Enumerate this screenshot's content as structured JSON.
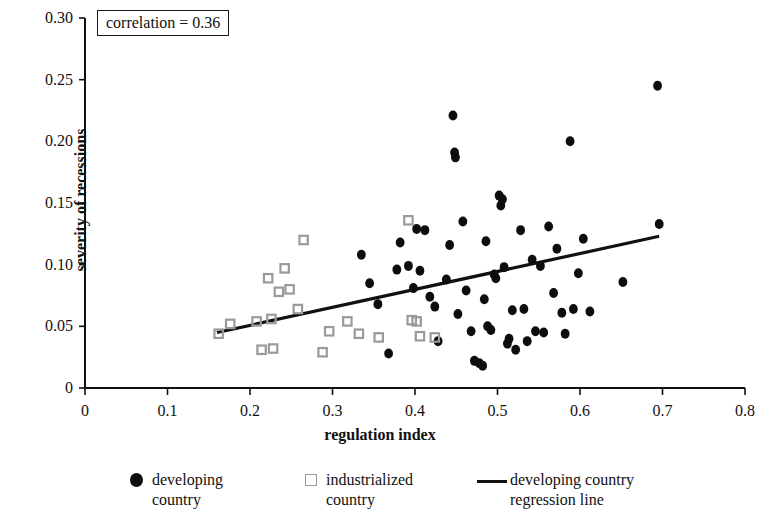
{
  "figure": {
    "annotation_label": "correlation = 0.36",
    "x_axis_title": "regulation index",
    "y_axis_title": "severity of recessions"
  },
  "legend": {
    "entries": [
      {
        "name": "developing-country",
        "label": "developing\ncountry",
        "marker": "filled-circle",
        "color": "#0d0d0d"
      },
      {
        "name": "industrialized-country",
        "label": "industrialized\ncountry",
        "marker": "open-square",
        "color": "#9a9a9a"
      },
      {
        "name": "regression-line",
        "label": "developing country\nregression line",
        "marker": "line",
        "color": "#111111"
      }
    ]
  },
  "chart_data": {
    "type": "scatter",
    "title": "",
    "xlabel": "regulation index",
    "ylabel": "severity of recessions",
    "xlim": [
      0,
      0.8
    ],
    "ylim": [
      0,
      0.3
    ],
    "xticks": [
      0,
      0.1,
      0.2,
      0.3,
      0.4,
      0.5,
      0.6,
      0.7,
      0.8
    ],
    "xtick_labels": [
      "0",
      "0.1",
      "0.2",
      "0.3",
      "0.4",
      "0.5",
      "0.6",
      "0.7",
      "0.8"
    ],
    "yticks": [
      0,
      0.05,
      0.1,
      0.15,
      0.2,
      0.25,
      0.3
    ],
    "ytick_labels": [
      "0",
      "0.05",
      "0.10",
      "0.15",
      "0.20",
      "0.25",
      "0.30"
    ],
    "grid": false,
    "legend_position": "below",
    "annotations": [
      {
        "text": "correlation = 0.36",
        "x": 0.015,
        "y": 0.295,
        "boxed": true
      }
    ],
    "series": [
      {
        "name": "developing country",
        "marker": "filled-circle",
        "color": "#0d0d0d",
        "points": [
          [
            0.335,
            0.108
          ],
          [
            0.345,
            0.085
          ],
          [
            0.355,
            0.068
          ],
          [
            0.368,
            0.028
          ],
          [
            0.378,
            0.096
          ],
          [
            0.382,
            0.118
          ],
          [
            0.392,
            0.099
          ],
          [
            0.398,
            0.081
          ],
          [
            0.402,
            0.129
          ],
          [
            0.406,
            0.095
          ],
          [
            0.412,
            0.128
          ],
          [
            0.418,
            0.074
          ],
          [
            0.424,
            0.066
          ],
          [
            0.428,
            0.038
          ],
          [
            0.438,
            0.088
          ],
          [
            0.442,
            0.116
          ],
          [
            0.446,
            0.221
          ],
          [
            0.448,
            0.191
          ],
          [
            0.449,
            0.187
          ],
          [
            0.452,
            0.06
          ],
          [
            0.458,
            0.135
          ],
          [
            0.462,
            0.079
          ],
          [
            0.468,
            0.046
          ],
          [
            0.472,
            0.022
          ],
          [
            0.478,
            0.02
          ],
          [
            0.482,
            0.018
          ],
          [
            0.484,
            0.072
          ],
          [
            0.486,
            0.119
          ],
          [
            0.488,
            0.05
          ],
          [
            0.492,
            0.047
          ],
          [
            0.496,
            0.092
          ],
          [
            0.498,
            0.089
          ],
          [
            0.502,
            0.156
          ],
          [
            0.504,
            0.148
          ],
          [
            0.506,
            0.153
          ],
          [
            0.508,
            0.098
          ],
          [
            0.512,
            0.036
          ],
          [
            0.514,
            0.04
          ],
          [
            0.518,
            0.063
          ],
          [
            0.522,
            0.031
          ],
          [
            0.528,
            0.128
          ],
          [
            0.532,
            0.064
          ],
          [
            0.536,
            0.038
          ],
          [
            0.542,
            0.104
          ],
          [
            0.546,
            0.046
          ],
          [
            0.552,
            0.099
          ],
          [
            0.556,
            0.045
          ],
          [
            0.562,
            0.131
          ],
          [
            0.568,
            0.077
          ],
          [
            0.572,
            0.113
          ],
          [
            0.578,
            0.061
          ],
          [
            0.582,
            0.044
          ],
          [
            0.588,
            0.2
          ],
          [
            0.592,
            0.064
          ],
          [
            0.598,
            0.093
          ],
          [
            0.604,
            0.121
          ],
          [
            0.612,
            0.062
          ],
          [
            0.652,
            0.086
          ],
          [
            0.694,
            0.245
          ],
          [
            0.696,
            0.133
          ]
        ]
      },
      {
        "name": "industrialized country",
        "marker": "open-square",
        "color": "#9a9a9a",
        "points": [
          [
            0.162,
            0.044
          ],
          [
            0.176,
            0.052
          ],
          [
            0.208,
            0.054
          ],
          [
            0.214,
            0.031
          ],
          [
            0.222,
            0.089
          ],
          [
            0.226,
            0.056
          ],
          [
            0.228,
            0.032
          ],
          [
            0.235,
            0.078
          ],
          [
            0.242,
            0.097
          ],
          [
            0.248,
            0.08
          ],
          [
            0.258,
            0.064
          ],
          [
            0.265,
            0.12
          ],
          [
            0.288,
            0.029
          ],
          [
            0.296,
            0.046
          ],
          [
            0.318,
            0.054
          ],
          [
            0.332,
            0.044
          ],
          [
            0.356,
            0.041
          ],
          [
            0.392,
            0.136
          ],
          [
            0.396,
            0.055
          ],
          [
            0.402,
            0.054
          ],
          [
            0.406,
            0.042
          ],
          [
            0.424,
            0.041
          ]
        ]
      }
    ],
    "regression_line": {
      "name": "developing country regression line",
      "color": "#111111",
      "x_start": 0.16,
      "y_start": 0.045,
      "x_end": 0.696,
      "y_end": 0.123
    }
  }
}
